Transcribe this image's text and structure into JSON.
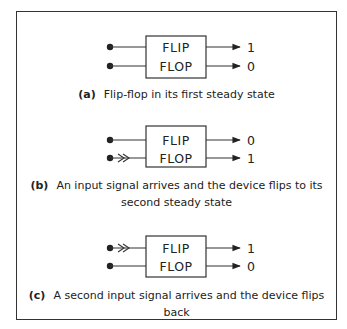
{
  "figure": {
    "panels": [
      {
        "id": "a",
        "box_label_top": "FLIP",
        "box_label_bottom": "FLOP",
        "input_top_signal": false,
        "input_bottom_signal": false,
        "output_top": "1",
        "output_bottom": "0",
        "caption_tag": "(a)",
        "caption_text": "Flip-flop in its first steady state"
      },
      {
        "id": "b",
        "box_label_top": "FLIP",
        "box_label_bottom": "FLOP",
        "input_top_signal": false,
        "input_bottom_signal": true,
        "output_top": "0",
        "output_bottom": "1",
        "caption_tag": "(b)",
        "caption_text_line1": "An input signal arrives and the device flips to its",
        "caption_text_line2": "second steady state"
      },
      {
        "id": "c",
        "box_label_top": "FLIP",
        "box_label_bottom": "FLOP",
        "input_top_signal": true,
        "input_bottom_signal": false,
        "output_top": "1",
        "output_bottom": "0",
        "caption_tag": "(c)",
        "caption_text": "A second input signal arrives and the device flips back"
      }
    ]
  }
}
